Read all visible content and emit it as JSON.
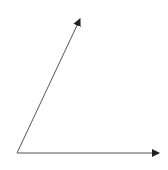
{
  "diagram": {
    "type": "angle",
    "background": "#ffffff",
    "stroke_color": "#555555",
    "arrowhead_color": "#222222",
    "vertex": {
      "x": 17,
      "y": 153
    },
    "rays": [
      {
        "name": "ray-upper",
        "from": {
          "x": 17,
          "y": 153
        },
        "to": {
          "x": 80,
          "y": 19
        }
      },
      {
        "name": "ray-horizontal",
        "from": {
          "x": 17,
          "y": 153
        },
        "to": {
          "x": 159,
          "y": 153
        }
      }
    ]
  }
}
